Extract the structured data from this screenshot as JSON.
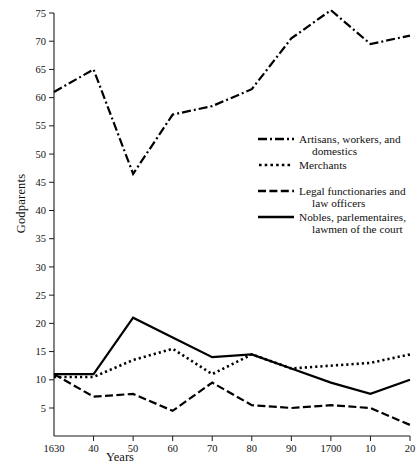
{
  "chart_data": {
    "type": "line",
    "title": "",
    "xlabel": "Years",
    "ylabel": "Godparents",
    "categories": [
      "1630",
      "40",
      "50",
      "60",
      "70",
      "80",
      "90",
      "1700",
      "10",
      "20"
    ],
    "x": [
      1630,
      1640,
      1650,
      1660,
      1670,
      1680,
      1690,
      1700,
      1710,
      1720
    ],
    "xlim": [
      1630,
      1720
    ],
    "ylim": [
      0,
      75
    ],
    "yticks": [
      5,
      10,
      15,
      20,
      25,
      30,
      35,
      40,
      45,
      50,
      55,
      60,
      65,
      70,
      75
    ],
    "grid": false,
    "legend_position": "center-right",
    "series": [
      {
        "name": "Artisans, workers, and domestics",
        "style": "dash-dot",
        "values": [
          61,
          65,
          46.5,
          57,
          58.5,
          61.5,
          70.5,
          75.5,
          69.5,
          71
        ]
      },
      {
        "name": "Merchants",
        "style": "dotted",
        "values": [
          10.5,
          10.5,
          13.5,
          15.5,
          11,
          14.5,
          12,
          12.5,
          13,
          14.5
        ]
      },
      {
        "name": "Legal functionaries and law officers",
        "style": "dashed",
        "values": [
          11,
          7,
          7.5,
          4.5,
          9.5,
          5.5,
          5,
          5.5,
          5,
          2
        ]
      },
      {
        "name": "Nobles, parlementaires, lawmen of the court",
        "style": "solid",
        "values": [
          11,
          11,
          21,
          17.5,
          14,
          14.5,
          12,
          9.5,
          7.5,
          10
        ]
      }
    ]
  },
  "axes": {
    "ylabel": "Godparents",
    "xlabel": "Years",
    "xticklabels": [
      "1630",
      "40",
      "50",
      "60",
      "70",
      "80",
      "90",
      "1700",
      "10",
      "20"
    ],
    "yticklabels": [
      "5",
      "10",
      "15",
      "20",
      "25",
      "30",
      "35",
      "40",
      "45",
      "50",
      "55",
      "60",
      "65",
      "70",
      "75"
    ]
  },
  "legend": {
    "entries": [
      {
        "line1": "Artisans, workers, and",
        "line2": "domestics",
        "style": "dash-dot"
      },
      {
        "line1": "Merchants",
        "line2": "",
        "style": "dotted"
      },
      {
        "line1": "Legal functionaries and",
        "line2": "law officers",
        "style": "dashed"
      },
      {
        "line1": "Nobles, parlementaires,",
        "line2": "lawmen of the court",
        "style": "solid"
      }
    ]
  },
  "colors": {
    "line": "#000000",
    "axis": "#1a1a1a",
    "background": "#ffffff"
  }
}
